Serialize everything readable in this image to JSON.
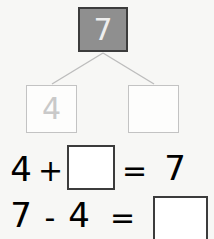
{
  "worksheet": {
    "type": "number-bond-and-equations",
    "background_color": "#f7f7f5"
  },
  "number_bond": {
    "whole": {
      "value": "7",
      "fill_color": "#8f8f8f",
      "border_color": "#3c3c3c",
      "text_color": "#eeeeee"
    },
    "parts": [
      {
        "value": "4",
        "fill_color": "#fdfdfc",
        "border_color": "#c3c3c3",
        "text_color": "#c9c9c9"
      },
      {
        "value": "",
        "fill_color": "#fdfdfc",
        "border_color": "#c3c3c3",
        "text_color": "#c9c9c9"
      }
    ],
    "connector_color": "#bdbdbd"
  },
  "equations": [
    {
      "left_operand": "4",
      "operator": "+",
      "blank_value": "",
      "equals": "=",
      "right_operand": "7",
      "blank_position": "second-operand",
      "box_border_color": "#3c3c3c"
    },
    {
      "left_operand": "7",
      "operator": "-",
      "right_operand": "4",
      "equals": "=",
      "blank_value": "",
      "blank_position": "result",
      "box_border_color": "#3c3c3c"
    }
  ]
}
